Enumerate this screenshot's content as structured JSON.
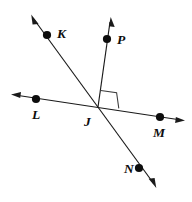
{
  "figure": {
    "background_color": "#ffffff",
    "stroke_color": "#1a1a1a",
    "label_color": "#0d0d0d",
    "width": 192,
    "height": 202
  },
  "labels": {
    "K": "K",
    "P": "P",
    "L": "L",
    "J": "J",
    "M": "M",
    "N": "N"
  },
  "points": [
    {
      "id": "K",
      "label": "K",
      "x": 47,
      "y": 35,
      "label_x": 57,
      "label_y": 38
    },
    {
      "id": "P",
      "label": "P",
      "x": 107,
      "y": 39,
      "label_x": 117,
      "label_y": 44
    },
    {
      "id": "L",
      "label": "L",
      "x": 36,
      "y": 99,
      "label_x": 32,
      "label_y": 119
    },
    {
      "id": "J",
      "label": "J",
      "x": 98,
      "y": 107,
      "label_x": 84,
      "label_y": 126
    },
    {
      "id": "M",
      "label": "M",
      "x": 160,
      "y": 117,
      "label_x": 153,
      "label_y": 137
    },
    {
      "id": "N",
      "label": "N",
      "x": 139,
      "y": 168,
      "label_x": 124,
      "label_y": 173
    }
  ],
  "lines": [
    {
      "id": "line-KN",
      "name": "line-K-J-N",
      "kind": "line",
      "through": [
        "K",
        "J",
        "N"
      ],
      "x1": 33,
      "y1": 18,
      "x2": 154,
      "y2": 184,
      "arrow_start": true,
      "arrow_end": true
    },
    {
      "id": "line-LM",
      "name": "line-L-J-M",
      "kind": "line",
      "through": [
        "L",
        "J",
        "M"
      ],
      "x1": 15,
      "y1": 95,
      "x2": 181,
      "y2": 120,
      "arrow_start": true,
      "arrow_end": true
    },
    {
      "id": "ray-JP",
      "name": "ray-J-P",
      "kind": "ray",
      "through": [
        "J",
        "P"
      ],
      "x1": 98,
      "y1": 107,
      "x2": 110,
      "y2": 19,
      "arrow_start": false,
      "arrow_end": true
    }
  ],
  "right_angle": {
    "id": "right-angle-PJM",
    "vertex": "J",
    "between": [
      "ray-JP",
      "line-LM"
    ],
    "measure_degrees": 90,
    "marker_size": 16
  }
}
